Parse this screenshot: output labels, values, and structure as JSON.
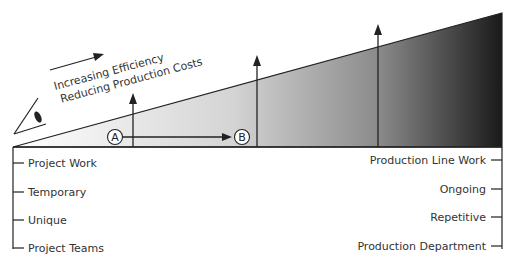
{
  "diagram": {
    "title_line1": "Increasing Efficiency",
    "title_line2": "Reducing Production Costs",
    "point_a": "A",
    "point_b": "B",
    "left_labels": [
      "Project Work",
      "Temporary",
      "Unique",
      "Project Teams"
    ],
    "right_labels": [
      "Production Line Work",
      "Ongoing",
      "Repetitive",
      "Production Department"
    ],
    "colors": {
      "line": "#222222",
      "gradient_start": "#ffffff",
      "gradient_end": "#1a1a1a"
    }
  }
}
